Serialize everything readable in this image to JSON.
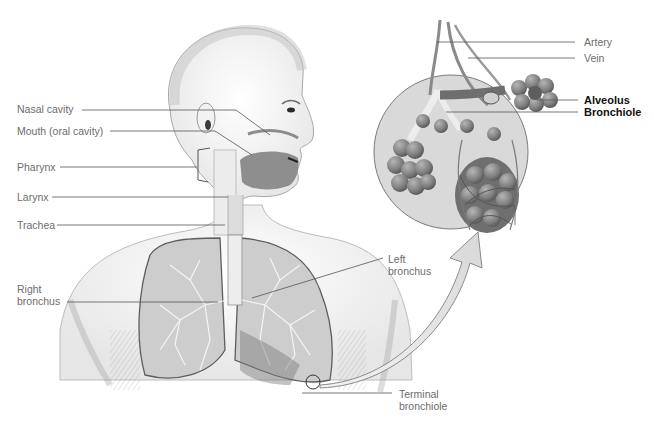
{
  "diagram": {
    "labels": {
      "nasal_cavity": "Nasal cavity",
      "mouth": "Mouth (oral cavity)",
      "pharynx": "Pharynx",
      "larynx": "Larynx",
      "trachea": "Trachea",
      "right_bronchus_1": "Right",
      "right_bronchus_2": "bronchus",
      "left_bronchus_1": "Left",
      "left_bronchus_2": "bronchus",
      "terminal_bronchiole_1": "Terminal",
      "terminal_bronchiole_2": "bronchiole",
      "artery": "Artery",
      "vein": "Vein",
      "alveolus": "Alveolus",
      "bronchiole": "Bronchiole"
    },
    "colors": {
      "background": "#ffffff",
      "label_text": "#6d6d6d",
      "emphasis_text": "#111111",
      "leader_line": "#555555",
      "magnifier_fill": "#d9d9d9",
      "alveoli_fill": "#8a8a8a",
      "lung_fill": "#c8c8c8"
    }
  }
}
